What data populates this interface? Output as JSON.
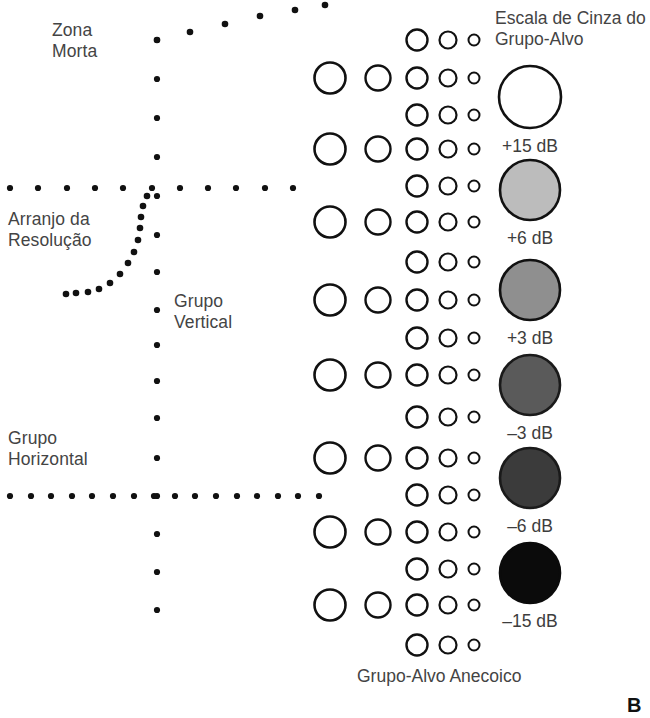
{
  "figure": {
    "panel_letter": "B",
    "background_color": "#ffffff",
    "ink_color": "#111111",
    "text_color": "#444444"
  },
  "labels": {
    "dead_zone": "Zona\nMorta",
    "resolution_array": "Arranjo da\nResolução",
    "vertical_group": "Grupo\nVertical",
    "horizontal_group": "Grupo\nHorizontal",
    "gray_scale_title": "Escala de Cinza do\nGrupo-Alvo",
    "bottom_caption": "Grupo-Alvo Anecoico"
  },
  "gray_scale": {
    "title": "Escala de Cinza do Grupo-Alvo",
    "targets": [
      {
        "label": "+15 dB",
        "fill": "#ffffff",
        "stroke": "#111111",
        "cy": 97,
        "r": 31
      },
      {
        "label": "+6 dB",
        "fill": "#bcbcbc",
        "stroke": "#111111",
        "cy": 190,
        "r": 30
      },
      {
        "label": "+3 dB",
        "fill": "#8f8f8f",
        "stroke": "#111111",
        "cy": 290,
        "r": 30
      },
      {
        "label": "-3 dB",
        "fill": "#5a5a5a",
        "stroke": "#1a1a1a",
        "cy": 385,
        "r": 30
      },
      {
        "label": "-6 dB",
        "fill": "#3b3b3b",
        "stroke": "#1a1a1a",
        "cy": 478,
        "r": 30
      },
      {
        "label": "-15 dB",
        "fill": "#0b0b0b",
        "stroke": "#0b0b0b",
        "cy": 573,
        "r": 30
      }
    ]
  },
  "anechoic_groups": {
    "caption": "Grupo-Alvo Anecoico",
    "note": "five columns of open circles, decreasing diameter left to right",
    "columns": [
      {
        "name": "column-1",
        "cx": 330,
        "r": 15.5,
        "rows": [
          78,
          149,
          222,
          300,
          375,
          458,
          532,
          605
        ]
      },
      {
        "name": "column-2",
        "cx": 378,
        "r": 12.5,
        "rows": [
          78,
          149,
          222,
          300,
          375,
          458,
          532,
          605
        ]
      },
      {
        "name": "column-3",
        "cx": 417,
        "r": 10.5,
        "rows": [
          40,
          78,
          115,
          149,
          186,
          222,
          262,
          300,
          338,
          375,
          417,
          458,
          495,
          532,
          569,
          605,
          645
        ]
      },
      {
        "name": "column-4",
        "cx": 448,
        "r": 8.5,
        "rows": [
          40,
          78,
          115,
          149,
          186,
          222,
          262,
          300,
          338,
          375,
          417,
          458,
          495,
          532,
          569,
          605,
          645
        ]
      },
      {
        "name": "column-5",
        "cx": 474,
        "r": 5.5,
        "rows": [
          40,
          78,
          115,
          149,
          186,
          222,
          262,
          300,
          338,
          375,
          417,
          458,
          495,
          532,
          569,
          605,
          645
        ]
      }
    ]
  },
  "dotted_features": {
    "vertical_column_x": 157,
    "vertical_dot_ys": [
      40,
      79,
      118,
      157,
      196,
      235,
      272,
      310,
      345,
      381,
      418,
      458,
      496,
      534,
      572,
      610
    ],
    "horizontal_line_upper_y": 188,
    "horizontal_line_lower_y": 496,
    "diagonal_dots": [
      [
        157,
        40
      ],
      [
        190,
        32
      ],
      [
        225,
        24
      ],
      [
        260,
        16
      ],
      [
        295,
        10
      ],
      [
        325,
        5
      ]
    ],
    "arc_dots": [
      [
        147,
        196
      ],
      [
        143,
        206
      ],
      [
        141,
        217
      ],
      [
        140,
        228
      ],
      [
        138,
        240
      ],
      [
        134,
        252
      ],
      [
        128,
        263
      ],
      [
        120,
        274
      ],
      [
        110,
        283
      ],
      [
        99,
        289
      ],
      [
        88,
        292
      ],
      [
        76,
        293
      ],
      [
        66,
        294
      ]
    ]
  }
}
